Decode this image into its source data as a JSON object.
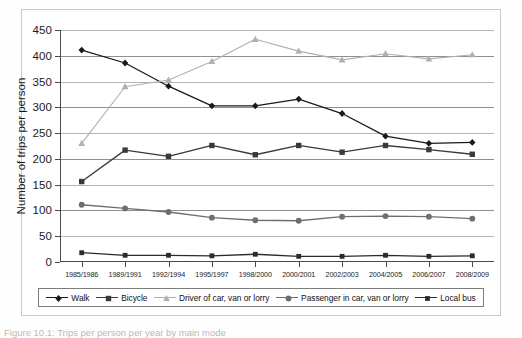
{
  "caption": "Figure 10.1: Trips per person per year by main mode",
  "chart_data": {
    "type": "line",
    "title": "",
    "xlabel": "",
    "ylabel": "Number of trips per person",
    "ylim": [
      0,
      450
    ],
    "ytick_step": 50,
    "yticks": [
      "0",
      "50",
      "100",
      "150",
      "200",
      "250",
      "300",
      "350",
      "400",
      "450"
    ],
    "grid": true,
    "legend_position": "bottom",
    "categories": [
      "1985/1986",
      "1989/1991",
      "1992/1994",
      "1995/1997",
      "1998/2000",
      "2000/2001",
      "2002/2003",
      "2004/2005",
      "2006/2007",
      "2008/2009"
    ],
    "series": [
      {
        "name": "Walk",
        "color": "#1a1a1a",
        "marker": "diamond",
        "values": [
          411,
          386,
          341,
          303,
          303,
          316,
          288,
          244,
          230,
          232
        ]
      },
      {
        "name": "Bicycle",
        "color": "#3a3a3a",
        "marker": "square",
        "values": [
          156,
          217,
          205,
          226,
          208,
          226,
          213,
          226,
          218,
          209
        ]
      },
      {
        "name": "Driver of car, van or lorry",
        "color": "#b0b0b0",
        "marker": "triangle",
        "values": [
          230,
          340,
          353,
          389,
          432,
          409,
          392,
          404,
          394,
          402
        ]
      },
      {
        "name": "Passenger in car, van or lorry",
        "color": "#6e6e6e",
        "marker": "circle",
        "values": [
          111,
          104,
          97,
          86,
          81,
          80,
          88,
          89,
          88,
          84
        ]
      },
      {
        "name": "Local bus",
        "color": "#2b2b2b",
        "marker": "square-small",
        "values": [
          18,
          13,
          13,
          12,
          15,
          11,
          11,
          13,
          11,
          12
        ]
      }
    ]
  }
}
